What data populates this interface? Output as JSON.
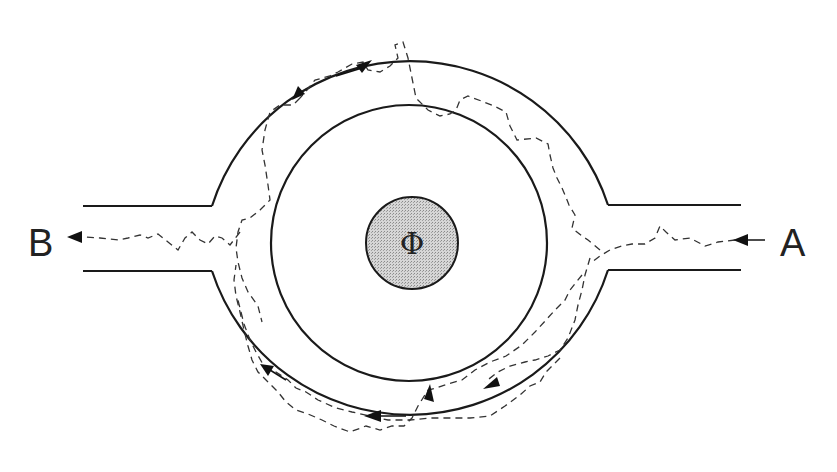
{
  "diagram": {
    "type": "Aharonov-Bohm ring schematic",
    "labels": {
      "left_terminal": "B",
      "right_terminal": "A",
      "flux_symbol": "Φ"
    },
    "colors": {
      "line": "#1a1a1a",
      "flux_fill": "#c8c8c8",
      "path": "#333333",
      "background": "#ffffff"
    },
    "elements": [
      {
        "name": "outer-ring",
        "shape": "circle",
        "cx": 409,
        "cy": 240,
        "r": 208
      },
      {
        "name": "inner-ring",
        "shape": "circle",
        "cx": 409,
        "cy": 243,
        "r": 138
      },
      {
        "name": "flux-region",
        "shape": "circle",
        "cx": 412,
        "cy": 243,
        "r": 46
      },
      {
        "name": "left-lead",
        "y_top": 206,
        "y_bottom": 271,
        "x_start": 83,
        "x_end": 212
      },
      {
        "name": "right-lead",
        "y_top": 205,
        "y_bottom": 270,
        "x_start": 608,
        "x_end": 741
      }
    ]
  }
}
